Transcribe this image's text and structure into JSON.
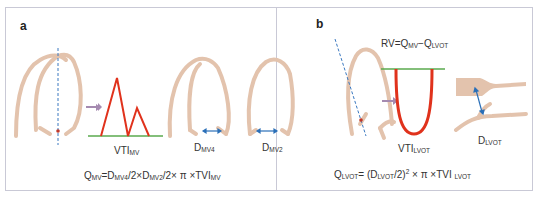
{
  "panels": {
    "a": {
      "label": "a",
      "vti_label": {
        "main": "VTI",
        "sub": "MV"
      },
      "d4_label": {
        "main": "D",
        "sub": "MV4"
      },
      "d2_label": {
        "main": "D",
        "sub": "MV2"
      },
      "formula": {
        "q": "Q",
        "q_sub": "MV",
        "eq": "=D",
        "d4_sub": "MV4",
        "mid": "/2×D",
        "d2_sub": "MV2",
        "tail": "/2× π ×TVI",
        "tvi_sub": "MV"
      }
    },
    "b": {
      "label": "b",
      "rv_formula": {
        "rv": "RV=Q",
        "q1_sub": "MV",
        "minus": "−Q",
        "q2_sub": "LVOT"
      },
      "vti_label": {
        "main": "VTI",
        "sub": "LVOT"
      },
      "d_label": {
        "main": "D",
        "sub": "LVOT"
      },
      "formula": {
        "q": "Q",
        "q_sub": "LVOT",
        "eq": "= (D",
        "d_sub": "LVOT",
        "mid": "/2)",
        "sup": "2",
        "tail": " × π ×TVI ",
        "tvi_sub": "LVOT"
      }
    }
  },
  "colors": {
    "tissue": "#e3c3ad",
    "tissue_edge": "#d2a98e",
    "doppler": "#e0321c",
    "baseline": "#5aaa4e",
    "scanline": "#3a78c0",
    "arrow": "#a58ab0",
    "measure": "#2a6fb8",
    "frame": "#c9c9d6"
  }
}
